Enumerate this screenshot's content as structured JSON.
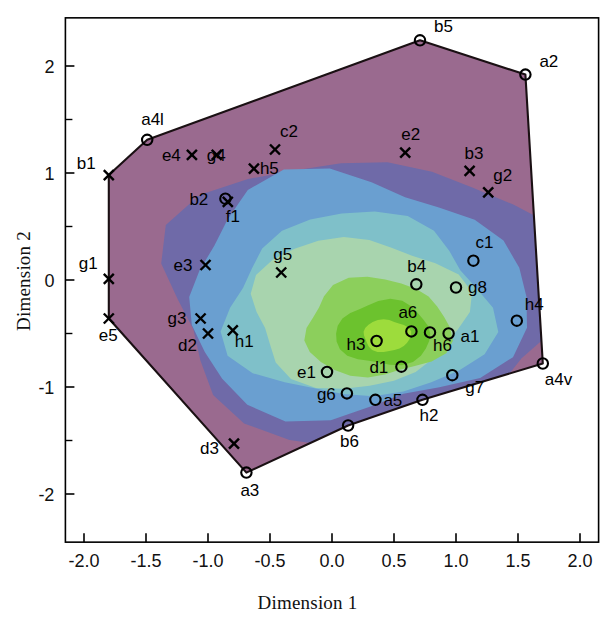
{
  "chart_data": {
    "type": "scatter",
    "title": "",
    "xlabel": "Dimension 1",
    "ylabel": "Dimension 2",
    "xlim": [
      -2.15,
      2.15
    ],
    "ylim": [
      -2.45,
      2.45
    ],
    "xticks": [
      "-2.0",
      "-1.5",
      "-1.0",
      "-0.5",
      "0.0",
      "0.5",
      "1.0",
      "1.5",
      "2.0"
    ],
    "xtick_values": [
      -2.0,
      -1.5,
      -1.0,
      -0.5,
      0.0,
      0.5,
      1.0,
      1.5,
      2.0
    ],
    "yticks": [
      "2",
      "1",
      "0",
      "-1",
      "-2"
    ],
    "ytick_values": [
      2,
      1,
      0,
      -1,
      -2
    ],
    "yminor_values": [
      1.5,
      0.5,
      -0.5,
      -1.5
    ],
    "grid": false,
    "legend": null,
    "marker_types": [
      "circle",
      "cross"
    ],
    "points": [
      {
        "label": "b5",
        "x": 0.71,
        "y": 2.24,
        "marker": "circle",
        "lx": 14,
        "ly": -8
      },
      {
        "label": "a2",
        "x": 1.56,
        "y": 1.92,
        "marker": "circle",
        "lx": 14,
        "ly": -8
      },
      {
        "label": "a4l",
        "x": -1.49,
        "y": 1.31,
        "marker": "circle",
        "lx": -6,
        "ly": -15
      },
      {
        "label": "b1",
        "x": -1.8,
        "y": 0.98,
        "marker": "cross",
        "lx": -32,
        "ly": -6
      },
      {
        "label": "c2",
        "x": -0.46,
        "y": 1.22,
        "marker": "cross",
        "lx": 5,
        "ly": -13
      },
      {
        "label": "e2",
        "x": 0.59,
        "y": 1.19,
        "marker": "cross",
        "lx": -4,
        "ly": -13
      },
      {
        "label": "e4",
        "x": -1.13,
        "y": 1.17,
        "marker": "cross",
        "lx": -30,
        "ly": 6
      },
      {
        "label": "g4",
        "x": -0.93,
        "y": 1.17,
        "marker": "cross",
        "lx": -10,
        "ly": 6
      },
      {
        "label": "h5",
        "x": -0.63,
        "y": 1.04,
        "marker": "cross",
        "lx": 6,
        "ly": 5
      },
      {
        "label": "b3",
        "x": 1.11,
        "y": 1.02,
        "marker": "cross",
        "lx": -5,
        "ly": -12
      },
      {
        "label": "g2",
        "x": 1.26,
        "y": 0.82,
        "marker": "cross",
        "lx": 5,
        "ly": -11
      },
      {
        "label": "b2",
        "x": -0.86,
        "y": 0.76,
        "marker": "circle",
        "lx": -36,
        "ly": 6
      },
      {
        "label": "f1",
        "x": -0.84,
        "y": 0.73,
        "marker": "cross",
        "lx": -2,
        "ly": 20
      },
      {
        "label": "g1",
        "x": -1.8,
        "y": 0.01,
        "marker": "cross",
        "lx": -30,
        "ly": -10
      },
      {
        "label": "e3",
        "x": -1.02,
        "y": 0.14,
        "marker": "cross",
        "lx": -32,
        "ly": 6
      },
      {
        "label": "g5",
        "x": -0.41,
        "y": 0.07,
        "marker": "cross",
        "lx": -8,
        "ly": -13
      },
      {
        "label": "c1",
        "x": 1.14,
        "y": 0.18,
        "marker": "circle",
        "lx": 2,
        "ly": -13
      },
      {
        "label": "b4",
        "x": 0.68,
        "y": -0.04,
        "marker": "circle",
        "lx": -9,
        "ly": -12
      },
      {
        "label": "g8",
        "x": 1.0,
        "y": -0.07,
        "marker": "circle",
        "lx": 12,
        "ly": 5
      },
      {
        "label": "g3",
        "x": -1.06,
        "y": -0.36,
        "marker": "cross",
        "lx": -33,
        "ly": 5
      },
      {
        "label": "e5",
        "x": -1.8,
        "y": -0.36,
        "marker": "cross",
        "lx": -10,
        "ly": 22
      },
      {
        "label": "h4",
        "x": 1.49,
        "y": -0.38,
        "marker": "circle",
        "lx": 8,
        "ly": -11
      },
      {
        "label": "a6",
        "x": 0.64,
        "y": -0.48,
        "marker": "circle",
        "lx": -13,
        "ly": -13
      },
      {
        "label": "a1",
        "x": 0.94,
        "y": -0.5,
        "marker": "circle",
        "lx": 12,
        "ly": 8
      },
      {
        "label": "h6",
        "x": 0.79,
        "y": -0.49,
        "marker": "circle",
        "lx": 3,
        "ly": 19
      },
      {
        "label": "h3",
        "x": 0.36,
        "y": -0.57,
        "marker": "circle",
        "lx": -30,
        "ly": 9
      },
      {
        "label": "d2",
        "x": -1.0,
        "y": -0.5,
        "marker": "cross",
        "lx": -30,
        "ly": 17
      },
      {
        "label": "h1",
        "x": -0.8,
        "y": -0.47,
        "marker": "cross",
        "lx": 2,
        "ly": 17
      },
      {
        "label": "d1",
        "x": 0.56,
        "y": -0.81,
        "marker": "circle",
        "lx": -32,
        "ly": 6
      },
      {
        "label": "e1",
        "x": -0.04,
        "y": -0.86,
        "marker": "circle",
        "lx": -30,
        "ly": 6
      },
      {
        "label": "g7",
        "x": 0.97,
        "y": -0.89,
        "marker": "circle",
        "lx": 13,
        "ly": 18
      },
      {
        "label": "g6",
        "x": 0.12,
        "y": -1.06,
        "marker": "circle",
        "lx": -30,
        "ly": 7
      },
      {
        "label": "a5",
        "x": 0.35,
        "y": -1.12,
        "marker": "circle",
        "lx": 8,
        "ly": 6
      },
      {
        "label": "h2",
        "x": 0.73,
        "y": -1.12,
        "marker": "circle",
        "lx": -3,
        "ly": 21
      },
      {
        "label": "b6",
        "x": 0.13,
        "y": -1.36,
        "marker": "circle",
        "lx": -8,
        "ly": 21
      },
      {
        "label": "a4v",
        "x": 1.7,
        "y": -0.78,
        "marker": "circle",
        "lx": 2,
        "ly": 21
      },
      {
        "label": "d3",
        "x": -0.79,
        "y": -1.53,
        "marker": "cross",
        "lx": -34,
        "ly": 10
      },
      {
        "label": "a3",
        "x": -0.69,
        "y": -1.8,
        "marker": "circle",
        "lx": -6,
        "ly": 23
      }
    ],
    "hull_points": [
      "a4l",
      "b5",
      "a2",
      "a4v",
      "h2",
      "b6",
      "a3",
      "e5",
      "g1",
      "b1"
    ],
    "hull": [
      {
        "x": -1.49,
        "y": 1.31
      },
      {
        "x": 0.71,
        "y": 2.24
      },
      {
        "x": 1.56,
        "y": 1.92
      },
      {
        "x": 1.7,
        "y": -0.78
      },
      {
        "x": 0.73,
        "y": -1.12
      },
      {
        "x": 0.13,
        "y": -1.36
      },
      {
        "x": -0.69,
        "y": -1.8
      },
      {
        "x": -1.8,
        "y": -0.36
      },
      {
        "x": -1.8,
        "y": 0.01
      },
      {
        "x": -1.8,
        "y": 0.98
      }
    ],
    "colors": {
      "contour_outer_magenta": "#9a6a8f",
      "contour_violet": "#6f6aa8",
      "contour_blue": "#6a9fd0",
      "contour_teal": "#7fc0c9",
      "contour_pale_green": "#a8d4ae",
      "contour_green": "#8ccf5c",
      "contour_bright_green": "#6cc22e",
      "contour_core": "#9ddc3c",
      "axis": "#000000",
      "hull_line": "#1a1013"
    }
  }
}
